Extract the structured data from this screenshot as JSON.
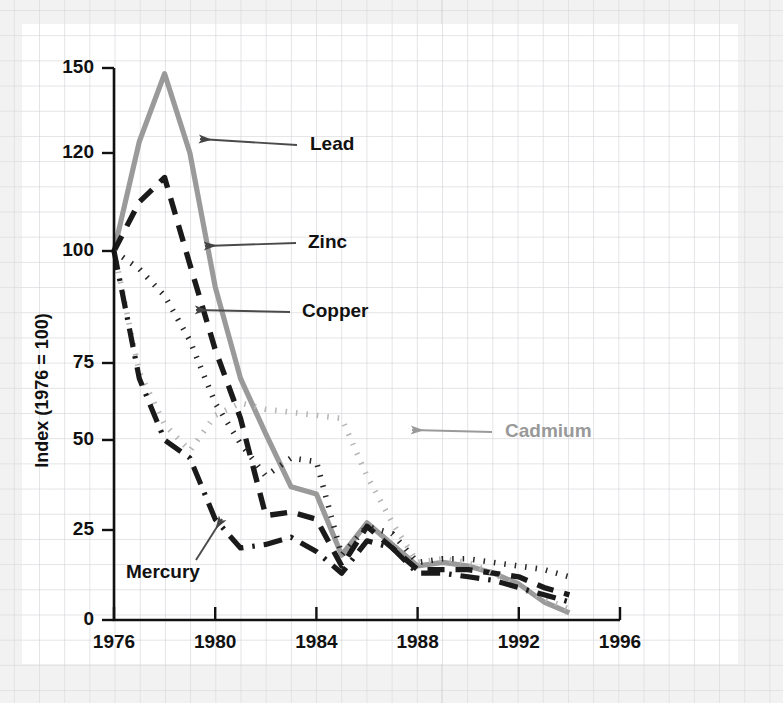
{
  "chart_data": {
    "type": "line",
    "title": "",
    "xlabel": "",
    "ylabel": "Index (1976 = 100)",
    "xlim": [
      1976,
      1996
    ],
    "ylim": [
      0,
      150
    ],
    "xticks": [
      1976,
      1980,
      1984,
      1988,
      1992,
      1996
    ],
    "yticks": [
      0,
      25,
      50,
      75,
      100,
      120,
      150
    ],
    "grid": true,
    "legend_position": "inline-annotations",
    "y_axis_note": "non-uniform spacing: 0,25,50,75,100,120,150",
    "x": [
      1976,
      1977,
      1978,
      1979,
      1980,
      1981,
      1982,
      1983,
      1984,
      1985,
      1986,
      1987,
      1988,
      1989,
      1990,
      1991,
      1992,
      1993,
      1994
    ],
    "series": [
      {
        "name": "Lead",
        "color": "#9a9a9a",
        "style": "solid",
        "values": [
          100,
          124,
          148,
          120,
          92,
          70,
          52,
          37,
          35,
          18,
          27,
          21,
          15,
          16,
          15,
          13,
          10,
          5,
          2
        ]
      },
      {
        "name": "Zinc",
        "color": "#1a1a1a",
        "style": "dashed",
        "values": [
          100,
          110,
          115,
          97,
          78,
          57,
          29,
          30,
          28,
          15,
          26,
          20,
          14,
          14,
          14,
          13,
          12,
          9,
          7
        ]
      },
      {
        "name": "Copper",
        "color": "#262626",
        "style": "dotted",
        "values": [
          100,
          96,
          90,
          80,
          62,
          49,
          40,
          45,
          44,
          18,
          26,
          24,
          16,
          17,
          17,
          16,
          15,
          14,
          12
        ]
      },
      {
        "name": "Cadmium",
        "color": "#b5b5b5",
        "style": "dotted",
        "values": [
          100,
          72,
          55,
          47,
          58,
          62,
          60,
          59,
          58,
          57,
          40,
          27,
          16,
          17,
          16,
          13,
          9,
          6,
          3
        ]
      },
      {
        "name": "Mercury",
        "color": "#1a1a1a",
        "style": "dashdot",
        "values": [
          100,
          70,
          50,
          45,
          28,
          20,
          21,
          23,
          19,
          13,
          22,
          20,
          13,
          13,
          12,
          11,
          9,
          7,
          5
        ]
      }
    ],
    "annotations": [
      {
        "label": "Lead",
        "color": "#111111",
        "text_x": 310,
        "text_y": 145,
        "arrow_from_x": 297,
        "arrow_from_y": 145,
        "arrow_to_x": 200,
        "arrow_to_y": 139
      },
      {
        "label": "Zinc",
        "color": "#111111",
        "text_x": 308,
        "text_y": 243,
        "arrow_from_x": 296,
        "arrow_from_y": 243,
        "arrow_to_x": 205,
        "arrow_to_y": 246
      },
      {
        "label": "Copper",
        "color": "#111111",
        "text_x": 302,
        "text_y": 312,
        "arrow_from_x": 290,
        "arrow_from_y": 312,
        "arrow_to_x": 196,
        "arrow_to_y": 310
      },
      {
        "label": "Cadmium",
        "color": "#999999",
        "text_x": 505,
        "text_y": 432,
        "arrow_from_x": 492,
        "arrow_from_y": 432,
        "arrow_to_x": 412,
        "arrow_to_y": 430
      },
      {
        "label": "Mercury",
        "color": "#111111",
        "text_x": 126,
        "text_y": 573,
        "arrow_from_x": 196,
        "arrow_from_y": 560,
        "arrow_to_x": 222,
        "arrow_to_y": 519
      }
    ]
  }
}
